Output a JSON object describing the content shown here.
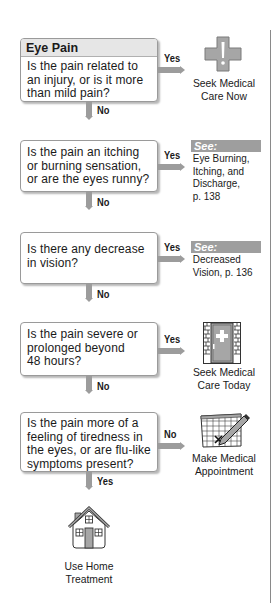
{
  "title": "Eye Pain",
  "steps": [
    {
      "question": "Is the pain related to an injury, or is it more than mild pain?",
      "question_lines": [
        "Is the pain related to",
        "an injury, or is it more",
        "than mild pain?"
      ],
      "branch_right_label": "Yes",
      "branch_down_label": "No",
      "outcome": {
        "type": "action",
        "icon": "medical-cross-icon",
        "lines": [
          "Seek Medical",
          "Care Now"
        ]
      }
    },
    {
      "question": "Is the pain an itching or burning sensation, or are the eyes runny?",
      "question_lines": [
        "Is the pain an itching",
        "or burning sensation,",
        "or are the eyes runny?"
      ],
      "branch_right_label": "Yes",
      "branch_down_label": "No",
      "outcome": {
        "type": "see",
        "tag": "See:",
        "lines": [
          "Eye Burning,",
          "Itching, and",
          "Discharge,",
          "p. 138"
        ]
      }
    },
    {
      "question": "Is there any decrease in vision?",
      "question_lines": [
        "Is there any decrease",
        "in vision?"
      ],
      "branch_right_label": "Yes",
      "branch_down_label": "No",
      "outcome": {
        "type": "see",
        "tag": "See:",
        "lines": [
          "Decreased",
          "Vision, p. 136"
        ]
      }
    },
    {
      "question": "Is the pain severe or prolonged beyond 48 hours?",
      "question_lines": [
        "Is the pain severe or",
        "prolonged beyond",
        "48 hours?"
      ],
      "branch_right_label": "Yes",
      "branch_down_label": "No",
      "outcome": {
        "type": "action",
        "icon": "clinic-door-icon",
        "lines": [
          "Seek Medical",
          "Care Today"
        ]
      }
    },
    {
      "question": "Is the pain more of a feeling of tiredness in the eyes, or are flu-like symptoms present?",
      "question_lines": [
        "Is the pain more of a",
        "feeling of tiredness in",
        "the eyes, or are flu-like",
        "symptoms present?"
      ],
      "branch_right_label": "No",
      "branch_down_label": "Yes",
      "outcome": {
        "type": "action",
        "icon": "calendar-appointment-icon",
        "lines": [
          "Make Medical",
          "Appointment"
        ]
      }
    }
  ],
  "final_outcome": {
    "icon": "home-icon",
    "lines": [
      "Use Home",
      "Treatment"
    ]
  },
  "colors": {
    "arrow": "#9c9c9c",
    "box_border": "#9a9a9a",
    "header_bg": "#e6e6e6",
    "see_tag_bg": "#9e9e9e",
    "icon_gray": "#a6a6a6"
  }
}
